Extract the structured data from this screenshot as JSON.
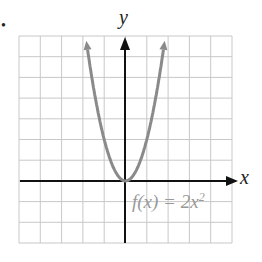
{
  "chart_data": {
    "type": "line",
    "title": "",
    "xlabel": "x",
    "ylabel": "y",
    "xlim": [
      -5,
      5
    ],
    "ylim": [
      -3,
      7
    ],
    "grid": true,
    "series": [
      {
        "name": "f(x) = 2x^2",
        "function": "2x^2",
        "x": [
          -1.9,
          -1.5,
          -1,
          -0.5,
          0,
          0.5,
          1,
          1.5,
          1.9
        ],
        "y": [
          7.22,
          4.5,
          2,
          0.5,
          0,
          0.5,
          2,
          4.5,
          7.22
        ],
        "color": "#8a8a8a"
      }
    ],
    "annotations": [
      {
        "text": "f(x) = 2x²",
        "x": 0.4,
        "y": -1
      }
    ]
  },
  "labels": {
    "bullet": "•",
    "y_axis": "y",
    "x_axis": "x",
    "func_main": "f(x) = 2x",
    "func_exp": "2"
  },
  "colors": {
    "grid": "#c8c8c8",
    "axis": "#111111",
    "curve": "#8a8a8a"
  }
}
